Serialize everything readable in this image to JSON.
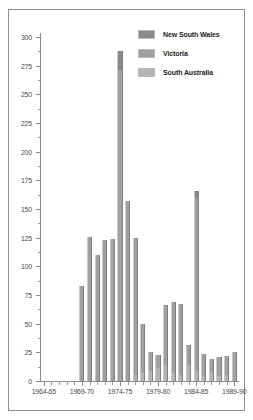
{
  "chart_data": {
    "type": "bar",
    "title": "",
    "subtitle": "",
    "xlabel": "",
    "ylabel": "",
    "stacked": true,
    "grid": false,
    "legend_position": "top-right",
    "ylim": [
      0,
      300
    ],
    "ytick_step": 25,
    "ytick_labels": [
      "0",
      "25",
      "50",
      "75",
      "100",
      "125",
      "150",
      "175",
      "200",
      "225",
      "250",
      "275",
      "300"
    ],
    "ytick_values": [
      0,
      25,
      50,
      75,
      100,
      125,
      150,
      175,
      200,
      225,
      250,
      275,
      300
    ],
    "yminor_step": 12.5,
    "xtick_labels": [
      "1964-65",
      "1969-70",
      "1974-75",
      "1979-80",
      "1984-85",
      "1989-90"
    ],
    "xtick_values": [
      0,
      5,
      10,
      15,
      20,
      25
    ],
    "categories": [
      "1964-65",
      "1965-66",
      "1966-67",
      "1967-68",
      "1968-69",
      "1969-70",
      "1970-71",
      "1971-72",
      "1972-73",
      "1973-74",
      "1974-75",
      "1975-76",
      "1976-77",
      "1977-78",
      "1978-79",
      "1979-80",
      "1980-81",
      "1981-82",
      "1982-83",
      "1983-84",
      "1984-85",
      "1985-86",
      "1986-87",
      "1987-88",
      "1988-89",
      "1989-90"
    ],
    "series": [
      {
        "name": "New South Wales",
        "color": "#8a8a8a",
        "values": [
          0,
          0,
          0,
          0,
          0,
          0,
          0,
          0,
          0,
          0,
          17,
          0,
          0,
          0,
          0,
          0,
          0,
          0,
          0,
          0,
          6,
          0,
          0,
          0,
          0,
          0
        ]
      },
      {
        "name": "Victoria",
        "color": "#a0a0a0",
        "values": [
          0,
          0,
          0,
          0,
          0,
          83,
          126,
          110,
          123,
          124,
          271,
          157,
          120,
          43,
          16,
          12,
          52,
          62,
          62,
          17,
          151,
          20,
          11,
          17,
          17,
          25
        ]
      },
      {
        "name": "South Australia",
        "color": "#b3b3b3",
        "values": [
          0,
          0,
          0,
          0,
          0,
          0,
          0,
          0,
          0,
          0,
          0,
          0,
          5,
          7,
          9,
          11,
          14,
          7,
          5,
          14,
          9,
          4,
          8,
          4,
          5,
          0
        ]
      }
    ],
    "totals": [
      0,
      0,
      0,
      0,
      0,
      83,
      126,
      110,
      123,
      124,
      288,
      157,
      125,
      50,
      25,
      23,
      66,
      69,
      67,
      31,
      166,
      24,
      19,
      21,
      22,
      25
    ]
  },
  "legend": {
    "items": [
      {
        "label": "New South Wales",
        "color": "#8a8a8a"
      },
      {
        "label": "Victoria",
        "color": "#a0a0a0"
      },
      {
        "label": "South Australia",
        "color": "#b3b3b3"
      }
    ]
  }
}
